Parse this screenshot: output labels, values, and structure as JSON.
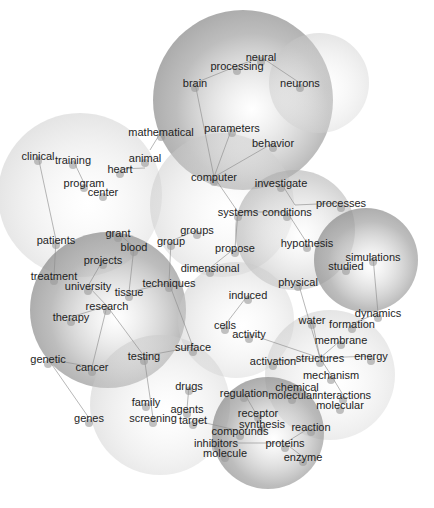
{
  "diagram": {
    "type": "topic-cluster-network",
    "clusters": [
      {
        "id": "neuro",
        "cx": 243,
        "cy": 100,
        "r": 90,
        "tone": "dark"
      },
      {
        "id": "neurons",
        "cx": 319,
        "cy": 83,
        "r": 50,
        "tone": "light"
      },
      {
        "id": "clinical",
        "cx": 80,
        "cy": 195,
        "r": 82,
        "tone": "light"
      },
      {
        "id": "computer",
        "cx": 222,
        "cy": 205,
        "r": 72,
        "tone": "light"
      },
      {
        "id": "hypothesis",
        "cx": 295,
        "cy": 230,
        "r": 60,
        "tone": "medium"
      },
      {
        "id": "simulations",
        "cx": 366,
        "cy": 260,
        "r": 52,
        "tone": "dark"
      },
      {
        "id": "research",
        "cx": 108,
        "cy": 310,
        "r": 78,
        "tone": "dark"
      },
      {
        "id": "cells",
        "cx": 236,
        "cy": 320,
        "r": 58,
        "tone": "light"
      },
      {
        "id": "materials",
        "cx": 330,
        "cy": 375,
        "r": 65,
        "tone": "light"
      },
      {
        "id": "drugs",
        "cx": 160,
        "cy": 405,
        "r": 70,
        "tone": "light"
      },
      {
        "id": "proteins",
        "cx": 268,
        "cy": 433,
        "r": 56,
        "tone": "dark"
      }
    ],
    "terms": [
      {
        "label": "brain",
        "x": 195,
        "y": 83
      },
      {
        "label": "processing",
        "x": 237,
        "y": 66
      },
      {
        "label": "neural",
        "x": 261,
        "y": 57
      },
      {
        "label": "neurons",
        "x": 300,
        "y": 83
      },
      {
        "label": "parameters",
        "x": 232,
        "y": 128
      },
      {
        "label": "behavior",
        "x": 273,
        "y": 143
      },
      {
        "label": "mathematical",
        "x": 161,
        "y": 132
      },
      {
        "label": "clinical",
        "x": 38,
        "y": 156
      },
      {
        "label": "training",
        "x": 73,
        "y": 160
      },
      {
        "label": "animal",
        "x": 145,
        "y": 158
      },
      {
        "label": "heart",
        "x": 120,
        "y": 169
      },
      {
        "label": "program",
        "x": 84,
        "y": 183
      },
      {
        "label": "center",
        "x": 103,
        "y": 192
      },
      {
        "label": "computer",
        "x": 214,
        "y": 177
      },
      {
        "label": "investigate",
        "x": 281,
        "y": 183
      },
      {
        "label": "processes",
        "x": 341,
        "y": 203
      },
      {
        "label": "systems",
        "x": 238,
        "y": 212
      },
      {
        "label": "conditions",
        "x": 287,
        "y": 212
      },
      {
        "label": "hypothesis",
        "x": 307,
        "y": 243
      },
      {
        "label": "groups",
        "x": 197,
        "y": 230
      },
      {
        "label": "group",
        "x": 171,
        "y": 241
      },
      {
        "label": "propose",
        "x": 235,
        "y": 248
      },
      {
        "label": "simulations",
        "x": 373,
        "y": 257
      },
      {
        "label": "studied",
        "x": 346,
        "y": 266
      },
      {
        "label": "patients",
        "x": 56,
        "y": 240
      },
      {
        "label": "grant",
        "x": 118,
        "y": 233
      },
      {
        "label": "blood",
        "x": 134,
        "y": 247
      },
      {
        "label": "projects",
        "x": 103,
        "y": 260
      },
      {
        "label": "dimensional",
        "x": 210,
        "y": 268
      },
      {
        "label": "physical",
        "x": 298,
        "y": 282
      },
      {
        "label": "treatment",
        "x": 54,
        "y": 276
      },
      {
        "label": "university",
        "x": 88,
        "y": 286
      },
      {
        "label": "techniques",
        "x": 169,
        "y": 283
      },
      {
        "label": "tissue",
        "x": 129,
        "y": 292
      },
      {
        "label": "induced",
        "x": 248,
        "y": 295
      },
      {
        "label": "research",
        "x": 107,
        "y": 306
      },
      {
        "label": "dynamics",
        "x": 378,
        "y": 313
      },
      {
        "label": "therapy",
        "x": 71,
        "y": 317
      },
      {
        "label": "water",
        "x": 312,
        "y": 320
      },
      {
        "label": "formation",
        "x": 352,
        "y": 324
      },
      {
        "label": "cells",
        "x": 225,
        "y": 325
      },
      {
        "label": "activity",
        "x": 249,
        "y": 334
      },
      {
        "label": "membrane",
        "x": 341,
        "y": 340
      },
      {
        "label": "surface",
        "x": 193,
        "y": 347
      },
      {
        "label": "energy",
        "x": 371,
        "y": 356
      },
      {
        "label": "activation",
        "x": 273,
        "y": 361
      },
      {
        "label": "structures",
        "x": 320,
        "y": 358
      },
      {
        "label": "genetic",
        "x": 48,
        "y": 359
      },
      {
        "label": "testing",
        "x": 144,
        "y": 356
      },
      {
        "label": "cancer",
        "x": 92,
        "y": 367
      },
      {
        "label": "mechanism",
        "x": 331,
        "y": 375
      },
      {
        "label": "drugs",
        "x": 189,
        "y": 386
      },
      {
        "label": "regulation",
        "x": 244,
        "y": 393
      },
      {
        "label": "chemical",
        "x": 297,
        "y": 387
      },
      {
        "label": "molecular",
        "x": 292,
        "y": 395
      },
      {
        "label": "interactions",
        "x": 343,
        "y": 395
      },
      {
        "label": "molecular",
        "x": 340,
        "y": 405
      },
      {
        "label": "family",
        "x": 146,
        "y": 402
      },
      {
        "label": "agents",
        "x": 187,
        "y": 409
      },
      {
        "label": "receptor",
        "x": 258,
        "y": 413
      },
      {
        "label": "genes",
        "x": 89,
        "y": 418
      },
      {
        "label": "screening",
        "x": 153,
        "y": 418
      },
      {
        "label": "target",
        "x": 193,
        "y": 420
      },
      {
        "label": "synthesis",
        "x": 262,
        "y": 424
      },
      {
        "label": "reaction",
        "x": 311,
        "y": 427
      },
      {
        "label": "compounds",
        "x": 240,
        "y": 431
      },
      {
        "label": "inhibitors",
        "x": 216,
        "y": 443
      },
      {
        "label": "proteins",
        "x": 285,
        "y": 443
      },
      {
        "label": "molecule",
        "x": 225,
        "y": 453
      },
      {
        "label": "enzyme",
        "x": 303,
        "y": 457
      }
    ],
    "edges": [
      [
        195,
        83,
        237,
        66
      ],
      [
        237,
        66,
        261,
        57
      ],
      [
        261,
        57,
        300,
        83
      ],
      [
        195,
        83,
        214,
        177
      ],
      [
        232,
        128,
        214,
        177
      ],
      [
        273,
        143,
        214,
        177
      ],
      [
        161,
        132,
        150,
        150
      ],
      [
        38,
        156,
        56,
        240
      ],
      [
        73,
        160,
        84,
        183
      ],
      [
        120,
        169,
        145,
        168
      ],
      [
        214,
        177,
        238,
        212
      ],
      [
        238,
        212,
        287,
        212
      ],
      [
        287,
        212,
        307,
        243
      ],
      [
        281,
        183,
        295,
        205
      ],
      [
        295,
        205,
        341,
        203
      ],
      [
        238,
        212,
        235,
        248
      ],
      [
        197,
        230,
        171,
        241
      ],
      [
        171,
        241,
        169,
        283
      ],
      [
        235,
        248,
        210,
        268
      ],
      [
        366,
        255,
        373,
        257
      ],
      [
        373,
        257,
        378,
        313
      ],
      [
        118,
        233,
        134,
        247
      ],
      [
        134,
        247,
        129,
        292
      ],
      [
        103,
        260,
        88,
        286
      ],
      [
        56,
        240,
        54,
        276
      ],
      [
        88,
        286,
        107,
        306
      ],
      [
        129,
        292,
        169,
        283
      ],
      [
        107,
        306,
        71,
        317
      ],
      [
        107,
        306,
        92,
        367
      ],
      [
        107,
        306,
        144,
        356
      ],
      [
        248,
        295,
        225,
        325
      ],
      [
        249,
        334,
        320,
        358
      ],
      [
        169,
        283,
        193,
        347
      ],
      [
        298,
        282,
        320,
        358
      ],
      [
        312,
        320,
        320,
        358
      ],
      [
        341,
        340,
        320,
        358
      ],
      [
        378,
        313,
        352,
        324
      ],
      [
        371,
        356,
        320,
        358
      ],
      [
        273,
        361,
        320,
        358
      ],
      [
        320,
        358,
        331,
        375
      ],
      [
        331,
        375,
        343,
        395
      ],
      [
        48,
        359,
        92,
        367
      ],
      [
        48,
        359,
        89,
        418
      ],
      [
        144,
        356,
        153,
        418
      ],
      [
        189,
        386,
        187,
        409
      ],
      [
        193,
        420,
        240,
        431
      ],
      [
        216,
        443,
        285,
        443
      ],
      [
        244,
        393,
        262,
        424
      ],
      [
        285,
        443,
        311,
        427
      ],
      [
        285,
        443,
        303,
        457
      ],
      [
        193,
        347,
        144,
        356
      ]
    ]
  }
}
